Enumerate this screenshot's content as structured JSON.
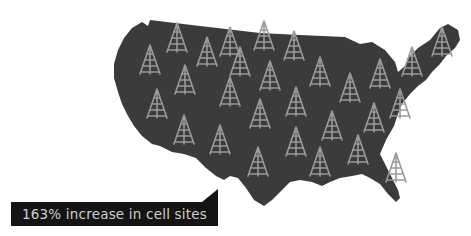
{
  "caption": {
    "text": "163% increase in cell sites"
  },
  "map": {
    "region": "United States",
    "fill_color": "#3b3b3d",
    "icon": "cell-tower-icon",
    "icon_color": "#9a9a9a",
    "tower_count": 28
  },
  "colors": {
    "background": "#ffffff",
    "label_background": "#141414",
    "label_text": "#cfcfcf"
  }
}
